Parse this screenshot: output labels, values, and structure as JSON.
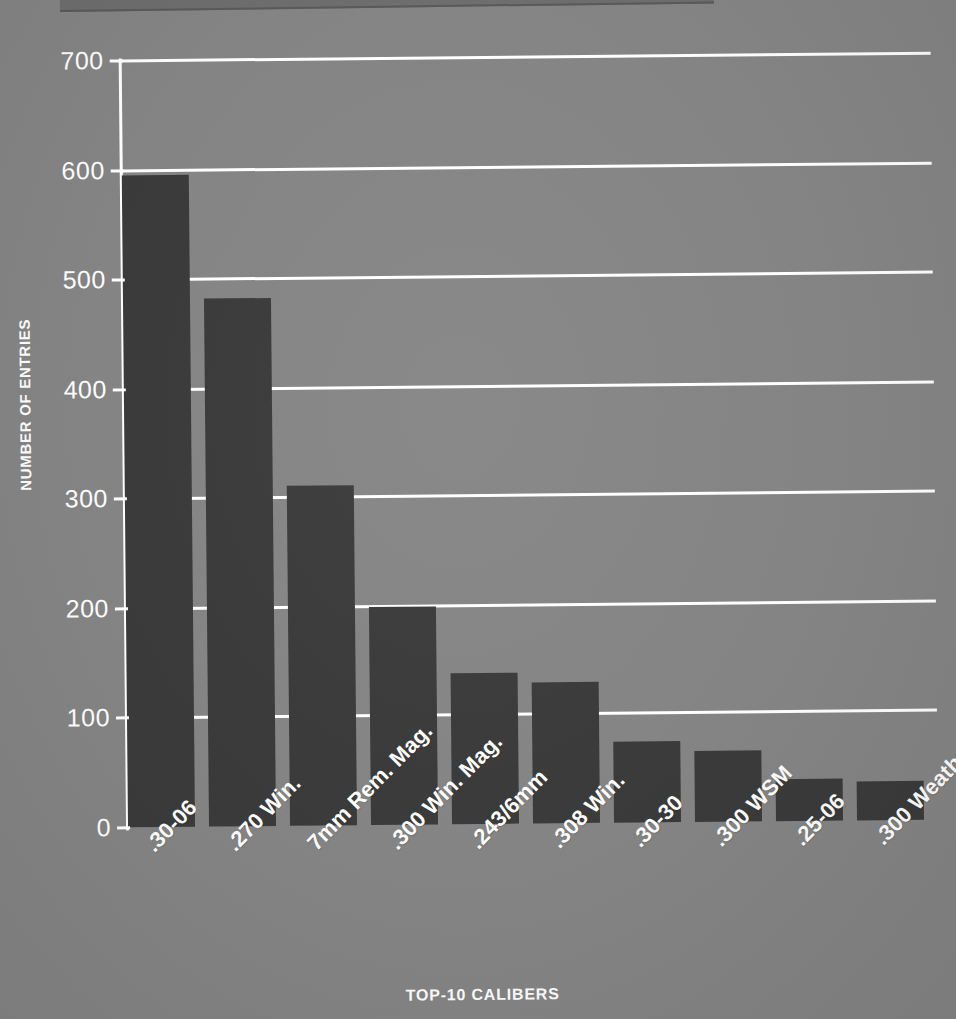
{
  "chart_data": {
    "type": "bar",
    "title": "",
    "xlabel": "TOP-10 CALIBERS",
    "ylabel": "NUMBER OF ENTRIES",
    "categories": [
      ".30-06",
      ".270 Win.",
      "7mm Rem. Mag.",
      ".300 Win. Mag.",
      ".243/6mm",
      ".308 Win.",
      ".30-30",
      ".300 WSM",
      ".25-06",
      ".300 Weatherby"
    ],
    "values": [
      595,
      482,
      310,
      199,
      138,
      129,
      74,
      65,
      38,
      36
    ],
    "ylim": [
      0,
      700
    ],
    "yticks": [
      0,
      100,
      200,
      300,
      400,
      500,
      600,
      700
    ],
    "ytick_labels": [
      "0",
      "100",
      "200",
      "300",
      "400",
      "500",
      "600",
      "700"
    ],
    "grid": true,
    "legend": false,
    "bar_color": "#3b3b3b",
    "grid_color": "#ffffff",
    "background_color": "#858585",
    "text_color": "#ffffff"
  }
}
